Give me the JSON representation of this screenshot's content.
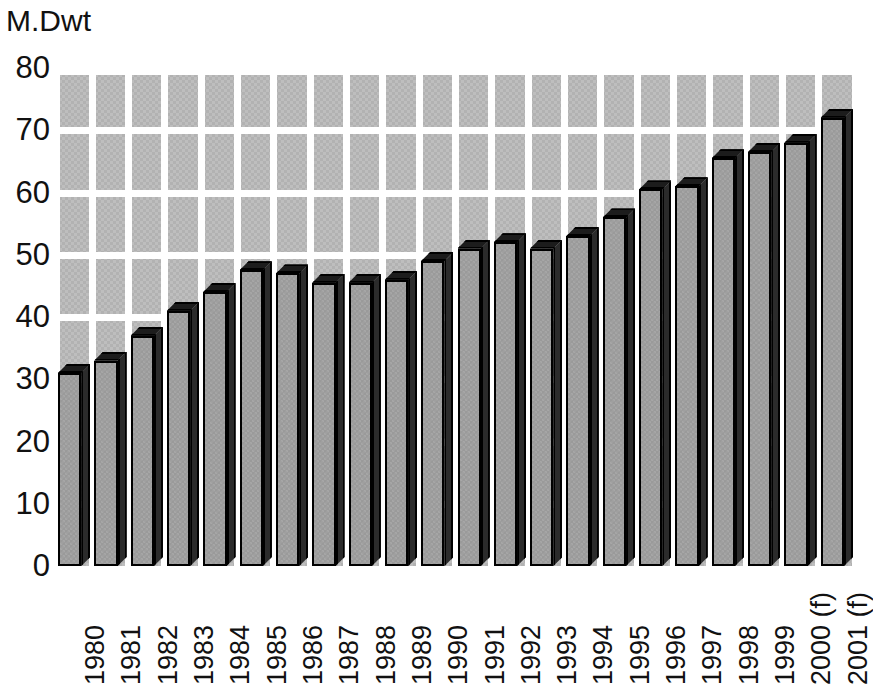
{
  "chart_data": {
    "type": "bar",
    "title": "",
    "subtitle": "",
    "xlabel": "",
    "ylabel": "M.Dwt",
    "ylim": [
      0,
      80
    ],
    "ytick_values": [
      80,
      70,
      60,
      50,
      40,
      30,
      20,
      10,
      0
    ],
    "ytick_labels": [
      "80",
      "70",
      "60",
      "50",
      "40",
      "30",
      "20",
      "10",
      "0"
    ],
    "grid": true,
    "legend": "none",
    "categories": [
      "1980",
      "1981",
      "1982",
      "1983",
      "1984",
      "1985",
      "1986",
      "1987",
      "1988",
      "1989",
      "1990",
      "1991",
      "1992",
      "1993",
      "1994",
      "1995",
      "1996",
      "1997",
      "1998",
      "1999",
      "2000 (f)",
      "2001 (f)"
    ],
    "values": [
      31,
      33,
      37,
      41,
      44,
      47.5,
      47,
      45.5,
      45.5,
      46,
      49,
      51,
      52,
      51,
      53,
      56,
      60.5,
      61,
      65.5,
      66.5,
      68,
      72
    ],
    "series": [
      {
        "name": "M.Dwt",
        "values": [
          31,
          33,
          37,
          41,
          44,
          47.5,
          47,
          45.5,
          45.5,
          46,
          49,
          51,
          52,
          51,
          53,
          56,
          60.5,
          61,
          65.5,
          66.5,
          68,
          72
        ]
      }
    ],
    "annotations": [
      "(f) denotes forecast"
    ],
    "colors": {
      "panel_background": "#b2b2b2",
      "gridline": "#ffffff",
      "bar_front": "#9a9a9a",
      "bar_side": "#2b2b2b",
      "bar_top": "#1c1c1c",
      "bar_outline": "#000000",
      "text": "#111111",
      "page_background": "#ffffff"
    }
  }
}
